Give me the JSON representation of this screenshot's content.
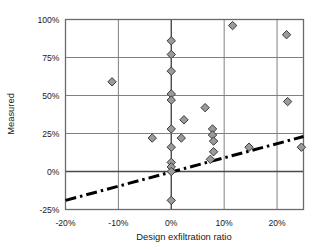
{
  "chart_data": {
    "type": "scatter",
    "title": "",
    "xlabel": "Design exfiltration ratio",
    "ylabel": "Measured",
    "xlim": [
      -20,
      25
    ],
    "ylim": [
      -25,
      100
    ],
    "xticks": [
      -20,
      -10,
      0,
      10,
      20
    ],
    "xtick_labels": [
      "-20%",
      "-10%",
      "0%",
      "10%",
      "20%"
    ],
    "yticks": [
      -25,
      0,
      25,
      50,
      75,
      100
    ],
    "ytick_labels": [
      "-25%",
      "0%",
      "25%",
      "50%",
      "75%",
      "100%"
    ],
    "grid": true,
    "grid_color": "#808080",
    "legend": "none",
    "marker": {
      "shape": "diamond",
      "fill": "#9a9a9a",
      "edge": "#3c3c3c",
      "size": 7
    },
    "series": [
      {
        "name": "Measured vs design exfiltration",
        "points": [
          {
            "x": -11.2,
            "y": 59
          },
          {
            "x": -3.6,
            "y": 22
          },
          {
            "x": 0.0,
            "y": 86
          },
          {
            "x": 0.0,
            "y": 77
          },
          {
            "x": 0.0,
            "y": 66
          },
          {
            "x": 0.0,
            "y": 51
          },
          {
            "x": 0.0,
            "y": 47
          },
          {
            "x": 0.0,
            "y": 28
          },
          {
            "x": 0.0,
            "y": 16
          },
          {
            "x": 0.0,
            "y": 6
          },
          {
            "x": 0.0,
            "y": 3
          },
          {
            "x": 0.0,
            "y": 0
          },
          {
            "x": 0.0,
            "y": -19
          },
          {
            "x": 1.9,
            "y": 22
          },
          {
            "x": 2.4,
            "y": 34
          },
          {
            "x": 6.4,
            "y": 42
          },
          {
            "x": 7.8,
            "y": 28
          },
          {
            "x": 7.8,
            "y": 24
          },
          {
            "x": 8.0,
            "y": 20
          },
          {
            "x": 8.0,
            "y": 13
          },
          {
            "x": 7.4,
            "y": 8
          },
          {
            "x": 11.6,
            "y": 96
          },
          {
            "x": 14.7,
            "y": 16
          },
          {
            "x": 21.8,
            "y": 90
          },
          {
            "x": 22.0,
            "y": 46
          },
          {
            "x": 24.6,
            "y": 16
          }
        ]
      }
    ],
    "trendline": {
      "style": "dash-dot",
      "color": "#000000",
      "width": 3,
      "x_start": -20,
      "y_start": -19,
      "x_end": 25,
      "y_end": 23
    }
  }
}
